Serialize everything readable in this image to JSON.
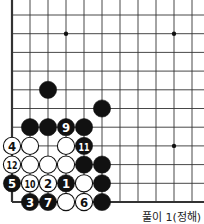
{
  "diagram": {
    "type": "go-board-problem",
    "caption": "풀이 1(정해)",
    "grid": {
      "origin_x": 12,
      "origin_y": 15,
      "dx": 18,
      "dy": 18.7,
      "cols": 11,
      "rows": 11,
      "left_edge": true,
      "bottom_edge": true
    },
    "colors": {
      "black": "#111111",
      "white": "#ffffff",
      "line": "#333333"
    },
    "star_points": [
      {
        "col": 3,
        "row": 1
      },
      {
        "col": 9,
        "row": 1
      },
      {
        "col": 9,
        "row": 7
      }
    ],
    "stones": [
      {
        "color": "black",
        "col": 2,
        "row": 4,
        "label": ""
      },
      {
        "color": "black",
        "col": 5,
        "row": 5,
        "label": ""
      },
      {
        "color": "black",
        "col": 1,
        "row": 6,
        "label": ""
      },
      {
        "color": "black",
        "col": 2,
        "row": 6,
        "label": ""
      },
      {
        "color": "black",
        "col": 3,
        "row": 6,
        "label": "9"
      },
      {
        "color": "black",
        "col": 4,
        "row": 6,
        "label": ""
      },
      {
        "color": "white",
        "col": 0,
        "row": 7,
        "label": "4"
      },
      {
        "color": "white",
        "col": 1,
        "row": 7,
        "label": ""
      },
      {
        "color": "white",
        "col": 3,
        "row": 7,
        "label": ""
      },
      {
        "color": "black",
        "col": 4,
        "row": 7,
        "label": "11"
      },
      {
        "color": "white",
        "col": 0,
        "row": 8,
        "label": "12"
      },
      {
        "color": "white",
        "col": 1,
        "row": 8,
        "label": ""
      },
      {
        "color": "white",
        "col": 2,
        "row": 8,
        "label": ""
      },
      {
        "color": "white",
        "col": 3,
        "row": 8,
        "label": ""
      },
      {
        "color": "black",
        "col": 4,
        "row": 8,
        "label": ""
      },
      {
        "color": "black",
        "col": 5,
        "row": 8,
        "label": ""
      },
      {
        "color": "black",
        "col": 0,
        "row": 9,
        "label": "5"
      },
      {
        "color": "white",
        "col": 1,
        "row": 9,
        "label": "10"
      },
      {
        "color": "white",
        "col": 2,
        "row": 9,
        "label": "2"
      },
      {
        "color": "black",
        "col": 3,
        "row": 9,
        "label": "1"
      },
      {
        "color": "white",
        "col": 4,
        "row": 9,
        "label": ""
      },
      {
        "color": "black",
        "col": 5,
        "row": 9,
        "label": ""
      },
      {
        "color": "black",
        "col": 1,
        "row": 10,
        "label": "3"
      },
      {
        "color": "black",
        "col": 2,
        "row": 10,
        "label": "7"
      },
      {
        "color": "white",
        "col": 3,
        "row": 10,
        "label": ""
      },
      {
        "color": "white",
        "col": 4,
        "row": 10,
        "label": "6"
      },
      {
        "color": "black",
        "col": 5,
        "row": 10,
        "label": ""
      }
    ]
  }
}
